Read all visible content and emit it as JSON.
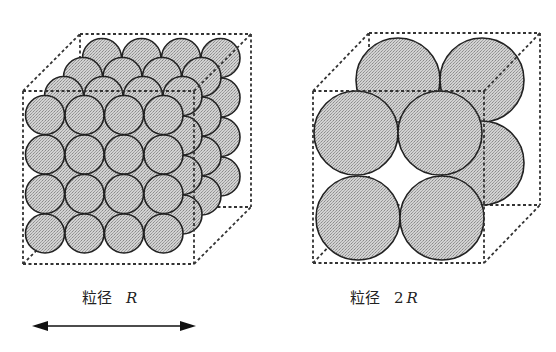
{
  "colors": {
    "sphere_fill": "#c9c9c9",
    "sphere_stroke": "#222222",
    "edge_stroke": "#333333",
    "text": "#222222"
  },
  "labels": {
    "left": {
      "prefix": "粒径",
      "coef": "",
      "var": "R"
    },
    "right": {
      "prefix": "粒径",
      "coef": "2",
      "var": "R"
    }
  },
  "left_cube": {
    "front": {
      "x": 23,
      "y": 91,
      "w": 171,
      "h": 173
    },
    "depth": {
      "dx": 57,
      "dy": -57
    },
    "sphere_radius": 19.5,
    "grid": {
      "cols": 4,
      "rows": 4,
      "layers": 4,
      "start_x": 45,
      "start_y": 115,
      "step": 39.5,
      "layer_dx": 19,
      "layer_dy": -19
    }
  },
  "right_cube": {
    "front": {
      "x": 313,
      "y": 91,
      "w": 171,
      "h": 172
    },
    "depth": {
      "dx": 56,
      "dy": -58
    },
    "sphere_radius": 42,
    "back_spheres": [
      [
        398,
        80
      ],
      [
        482,
        80
      ],
      [
        482,
        163
      ]
    ],
    "front_spheres": [
      [
        356,
        133
      ],
      [
        440,
        133
      ],
      [
        358,
        218
      ],
      [
        442,
        218
      ]
    ]
  },
  "arrow": {
    "x1": 32,
    "x2": 196,
    "y": 326,
    "direction": "double-headed"
  }
}
